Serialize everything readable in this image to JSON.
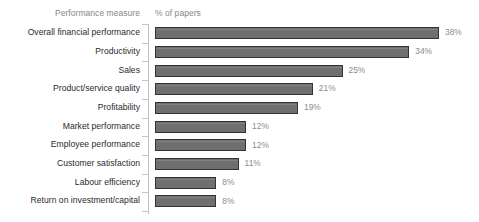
{
  "header": {
    "category_header": "Performance measure",
    "value_header": "% of papers"
  },
  "colors": {
    "bar_fill": "#6f6f6f",
    "bar_border": "#333333",
    "axis": "#bfbfbf",
    "tick": "#c4c4c4",
    "label_text": "#2b2b2b",
    "value_text": "#8c8c8c",
    "header_text": "#878787",
    "background": "#ffffff"
  },
  "chart_data": {
    "type": "bar",
    "orientation": "horizontal",
    "title": "",
    "subtitle": "",
    "xlabel": "% of papers",
    "ylabel": "Performance measure",
    "xlim": [
      0,
      40
    ],
    "grid": false,
    "legend": false,
    "value_suffix": "%",
    "categories": [
      "Overall financial performance",
      "Productivity",
      "Sales",
      "Product/service quality",
      "Profitability",
      "Market performance",
      "Employee performance",
      "Customer satisfaction",
      "Labour efficiency",
      "Return on investment/capital"
    ],
    "values": [
      38,
      34,
      25,
      21,
      19,
      12,
      12,
      11,
      8,
      8
    ],
    "value_labels": [
      "38%",
      "34%",
      "25%",
      "21%",
      "19%",
      "12%",
      "12%",
      "11%",
      "8%",
      "8%"
    ]
  }
}
